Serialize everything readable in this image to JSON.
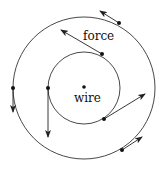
{
  "diagram": {
    "title": "",
    "labels": {
      "center": "wire",
      "force": "force"
    },
    "elements": {
      "wire_point": "wire",
      "field_circles": [
        "inner",
        "outer"
      ],
      "force_vectors": [
        {
          "circle": "inner",
          "position": "upper-right",
          "direction": "up-left",
          "label": "force"
        },
        {
          "circle": "inner",
          "position": "left",
          "direction": "down"
        },
        {
          "circle": "inner",
          "position": "lower-right",
          "direction": "up-right"
        },
        {
          "circle": "outer",
          "position": "upper-right",
          "direction": "up-left"
        },
        {
          "circle": "outer",
          "position": "left",
          "direction": "down"
        },
        {
          "circle": "outer",
          "position": "lower-right",
          "direction": "up-right"
        }
      ]
    },
    "colors": {
      "stroke": "#333333",
      "background": "#ffffff"
    }
  }
}
